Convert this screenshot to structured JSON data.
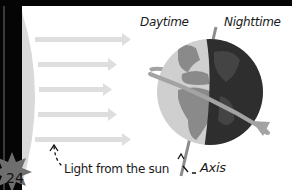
{
  "diagram": {
    "labels": {
      "daytime": "Daytime",
      "nighttime": "Nighttime",
      "light": "Light from the sun",
      "axis": "Axis"
    },
    "page_number": "24",
    "colors": {
      "background": "#ffffff",
      "frame": "#050505",
      "sun_edge": "#d9d9d9",
      "light_rays": "#dedede",
      "day_ocean": "#cfcfcf",
      "day_land": "#8a8a8a",
      "night_side": "#2e2e2e",
      "night_land": "#444444",
      "orbit_ring": "#a3a3a3",
      "axis_line": "#8c8c8c",
      "page_badge": "#6e6e6e"
    },
    "light_rays_count": 5
  }
}
